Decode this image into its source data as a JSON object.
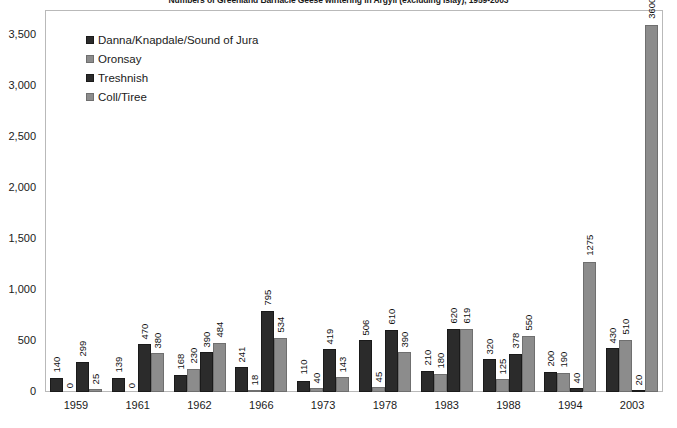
{
  "chart": {
    "title": "Numbers of Greenland Barnacle Geese wintering in Argyll (excluding Islay), 1959-2003"
  },
  "legend": {
    "position": "top-left",
    "items": [
      {
        "label": "Danna/Knapdale/Sound of Jura",
        "color": "#2b2b2b"
      },
      {
        "label": "Oronsay",
        "color": "#8c8c8c"
      },
      {
        "label": "Treshnish",
        "color": "#2b2b2b"
      },
      {
        "label": "Coll/Tiree",
        "color": "#8c8c8c"
      }
    ]
  },
  "y_axis": {
    "ticks": [
      "0",
      "500",
      "1,000",
      "1,500",
      "2,000",
      "2,500",
      "3,000",
      "3,500"
    ],
    "min": 0,
    "max": 3750
  },
  "x_axis": {
    "ticks": [
      "1959",
      "1961",
      "1962",
      "1966",
      "1973",
      "1978",
      "1983",
      "1988",
      "1994",
      "2003"
    ]
  },
  "chart_data": {
    "type": "bar",
    "title": "Numbers of Greenland Barnacle Geese wintering in Argyll (excluding Islay), 1959-2003",
    "xlabel": "",
    "ylabel": "",
    "ylim": [
      0,
      3750
    ],
    "ytick_step": 500,
    "grid": false,
    "legend_position": "top-left",
    "categories": [
      "1959",
      "1961",
      "1962",
      "1966",
      "1973",
      "1978",
      "1983",
      "1988",
      "1994",
      "2003"
    ],
    "series": [
      {
        "name": "Danna/Knapdale/Sound of Jura",
        "color": "#2b2b2b",
        "values": [
          140,
          139,
          168,
          241,
          110,
          506,
          210,
          320,
          200,
          430
        ]
      },
      {
        "name": "Oronsay",
        "color": "#8c8c8c",
        "values": [
          0,
          0,
          230,
          18,
          40,
          45,
          180,
          125,
          190,
          510
        ]
      },
      {
        "name": "Treshnish",
        "color": "#2b2b2b",
        "values": [
          299,
          470,
          390,
          795,
          419,
          610,
          620,
          378,
          40,
          20
        ]
      },
      {
        "name": "Coll/Tiree",
        "color": "#8c8c8c",
        "values": [
          25,
          380,
          484,
          534,
          143,
          390,
          619,
          550,
          1275,
          3600
        ]
      }
    ]
  }
}
